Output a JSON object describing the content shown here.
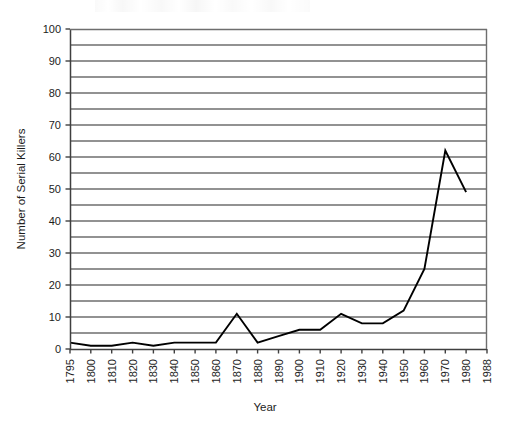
{
  "chart_data": {
    "type": "line",
    "title": "",
    "subtitle": "",
    "xlabel": "Year",
    "ylabel": "Number of Serial Killers",
    "ylim": [
      0,
      100
    ],
    "ytick_step": 10,
    "yminor_step": 5,
    "grid": "horizontal-major-and-minor",
    "legend": "none",
    "legend_position": "",
    "line_color": "#000000",
    "background_color": "#ffffff",
    "axis_color": "#444444",
    "grid_color": "#6e6e6e",
    "xtick_rotation": 90,
    "ytick_labels": [
      "0",
      "10",
      "20",
      "30",
      "40",
      "50",
      "60",
      "70",
      "80",
      "90",
      "100"
    ],
    "xtick_labels": [
      "1795",
      "1800",
      "1810",
      "1820",
      "1830",
      "1840",
      "1850",
      "1860",
      "1870",
      "1880",
      "1890",
      "1900",
      "1910",
      "1920",
      "1930",
      "1940",
      "1950",
      "1960",
      "1970",
      "1980",
      "1988"
    ],
    "categories": [
      "1795",
      "1800",
      "1810",
      "1820",
      "1830",
      "1840",
      "1850",
      "1860",
      "1870",
      "1880",
      "1890",
      "1900",
      "1910",
      "1920",
      "1930",
      "1940",
      "1950",
      "1960",
      "1970",
      "1980",
      "1988"
    ],
    "values": [
      2,
      1,
      1,
      2,
      1,
      2,
      2,
      2,
      11,
      2,
      4,
      6,
      6,
      11,
      8,
      8,
      12,
      25,
      62,
      49,
      null
    ],
    "series": [
      {
        "name": "Number of Serial Killers",
        "values": [
          2,
          1,
          1,
          2,
          1,
          2,
          2,
          2,
          11,
          2,
          4,
          6,
          6,
          11,
          8,
          8,
          12,
          25,
          62,
          49,
          null
        ]
      }
    ],
    "annotations": []
  }
}
